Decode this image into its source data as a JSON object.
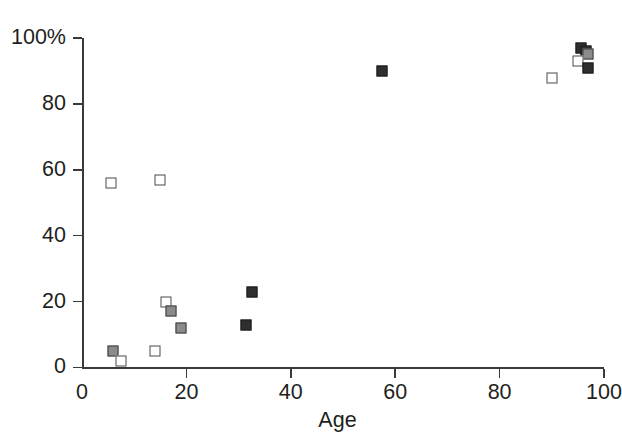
{
  "chart_data": {
    "type": "scatter",
    "title": "",
    "xlabel": "Age",
    "ylabel": "",
    "xlim": [
      0,
      100
    ],
    "ylim": [
      0,
      100
    ],
    "grid": false,
    "legend": "none",
    "x_ticks": [
      0,
      20,
      40,
      60,
      80,
      100
    ],
    "x_tick_labels": [
      "0",
      "20",
      "40",
      "60",
      "80",
      "100"
    ],
    "y_ticks": [
      0,
      20,
      40,
      60,
      80,
      100
    ],
    "y_tick_labels": [
      "0",
      "20",
      "40",
      "60",
      "80",
      "100%"
    ],
    "marker_styles": {
      "open": "#ffffff",
      "gray": "#8b8b8b",
      "dark": "#2f2f2f"
    },
    "points": [
      {
        "x": 5.5,
        "y": 56,
        "style": "open"
      },
      {
        "x": 6,
        "y": 5,
        "style": "gray"
      },
      {
        "x": 7.5,
        "y": 2,
        "style": "open"
      },
      {
        "x": 14,
        "y": 5,
        "style": "open"
      },
      {
        "x": 15,
        "y": 57,
        "style": "open"
      },
      {
        "x": 16,
        "y": 20,
        "style": "open"
      },
      {
        "x": 17,
        "y": 17,
        "style": "gray"
      },
      {
        "x": 19,
        "y": 12,
        "style": "gray"
      },
      {
        "x": 31.5,
        "y": 13,
        "style": "dark"
      },
      {
        "x": 32.5,
        "y": 23,
        "style": "dark"
      },
      {
        "x": 57.5,
        "y": 90,
        "style": "dark"
      },
      {
        "x": 90,
        "y": 88,
        "style": "open"
      },
      {
        "x": 95.5,
        "y": 97,
        "style": "dark"
      },
      {
        "x": 96.5,
        "y": 96,
        "style": "dark"
      },
      {
        "x": 97,
        "y": 95,
        "style": "gray"
      },
      {
        "x": 95,
        "y": 93,
        "style": "open"
      },
      {
        "x": 97,
        "y": 91,
        "style": "dark"
      }
    ]
  },
  "axes": {
    "x_title": "Age"
  }
}
